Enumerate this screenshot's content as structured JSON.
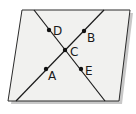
{
  "diagram": {
    "type": "geometry",
    "colors": {
      "plane_fill": "#f1f1ef",
      "plane_stroke": "#2a2a2a",
      "shadow": "#c8c8c8",
      "line": "#1a1a1a",
      "point": "#111111"
    },
    "plane": {
      "vertices": [
        [
          22,
          10
        ],
        [
          130,
          10
        ],
        [
          119,
          101
        ],
        [
          8,
          101
        ]
      ]
    },
    "lines": [
      {
        "name": "line-DCE",
        "from": [
          34,
          10
        ],
        "to": [
          105,
          101
        ],
        "points": [
          "D",
          "C",
          "E"
        ]
      },
      {
        "name": "line-ACB",
        "from": [
          16,
          101
        ],
        "to": [
          104,
          10
        ],
        "points": [
          "A",
          "C",
          "B"
        ]
      }
    ],
    "points": [
      {
        "label": "D",
        "x": 49,
        "y": 30,
        "lx": 53,
        "ly": 35
      },
      {
        "label": "B",
        "x": 84,
        "y": 31,
        "lx": 87,
        "ly": 42
      },
      {
        "label": "C",
        "x": 65,
        "y": 50,
        "lx": 70,
        "ly": 56
      },
      {
        "label": "A",
        "x": 46,
        "y": 69,
        "lx": 48,
        "ly": 80
      },
      {
        "label": "E",
        "x": 81,
        "y": 69,
        "lx": 85,
        "ly": 75
      }
    ]
  }
}
